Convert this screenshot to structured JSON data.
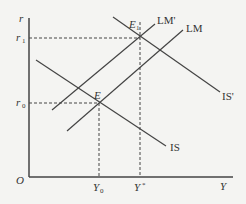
{
  "diagram": {
    "axes": {
      "y_label": "r",
      "x_label": "Y",
      "origin": "O"
    },
    "y_ticks": [
      {
        "label": "r",
        "sub": "1"
      },
      {
        "label": "r",
        "sub": "0"
      }
    ],
    "x_ticks": [
      {
        "label": "Y",
        "sub": "0"
      },
      {
        "label": "Y",
        "sub": "*"
      }
    ],
    "points": [
      {
        "label": "E",
        "sub": ""
      },
      {
        "label": "E",
        "sub": "1"
      }
    ],
    "curves": [
      {
        "name": "IS",
        "label": "IS"
      },
      {
        "name": "IS'",
        "label": "IS'"
      },
      {
        "name": "LM",
        "label": "LM"
      },
      {
        "name": "LM'",
        "label": "LM'"
      }
    ],
    "colors": {
      "line": "#333333",
      "background": "#f4f4f2"
    }
  }
}
